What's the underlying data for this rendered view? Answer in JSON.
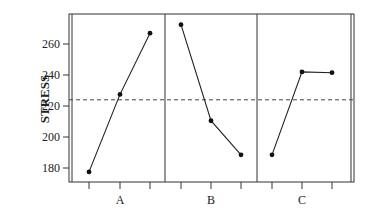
{
  "chart_data": {
    "type": "line",
    "title": "",
    "xlabel": "",
    "ylabel": "STRESS",
    "ylim": [
      170,
      278
    ],
    "yticks": [
      180,
      200,
      220,
      240,
      260
    ],
    "grid": false,
    "legend": null,
    "reference_line": {
      "value": 224,
      "style": "dashed",
      "label": "grand mean"
    },
    "panels": [
      {
        "name": "A",
        "levels": [
          1,
          2,
          3
        ],
        "values": [
          177.5,
          227.5,
          267
        ]
      },
      {
        "name": "B",
        "levels": [
          1,
          2,
          3
        ],
        "values": [
          272.5,
          210.5,
          188.5
        ]
      },
      {
        "name": "C",
        "levels": [
          1,
          2,
          3
        ],
        "values": [
          188.5,
          242,
          241.5
        ]
      }
    ]
  },
  "labels": {
    "ylabel": "STRESS",
    "yticks": [
      "180",
      "200",
      "220",
      "240",
      "260"
    ],
    "panels": [
      "A",
      "B",
      "C"
    ]
  }
}
